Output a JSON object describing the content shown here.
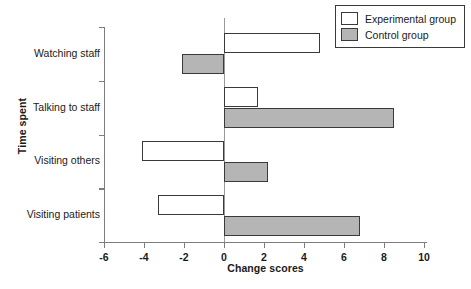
{
  "chart_data": {
    "type": "bar",
    "orientation": "horizontal",
    "title": "",
    "xlabel": "Change scores",
    "ylabel": "Time spent",
    "categories": [
      "Watching staff",
      "Talking to staff",
      "Visiting others",
      "Visiting patients"
    ],
    "series": [
      {
        "name": "Experimental group",
        "color": "#ffffff",
        "values": [
          4.8,
          1.7,
          -4.1,
          -3.3
        ]
      },
      {
        "name": "Control group",
        "color": "#b5b5b5",
        "values": [
          -2.1,
          8.5,
          2.2,
          6.8
        ]
      }
    ],
    "xlim": [
      -6,
      10
    ],
    "xticks": [
      -6,
      -4,
      -2,
      0,
      2,
      4,
      6,
      8,
      10
    ],
    "xtick_labels": [
      "-6",
      "-4",
      "-2",
      "0",
      "2",
      "4",
      "6",
      "8",
      "10"
    ],
    "grid": false,
    "legend_position": "top-right",
    "zero_reference_line": true
  },
  "legend": {
    "entries": [
      {
        "label": "Experimental group",
        "swatch": "white-swatch"
      },
      {
        "label": "Control group",
        "swatch": "gray-swatch"
      }
    ]
  },
  "colors": {
    "control_fill": "#b5b5b5",
    "experimental_fill": "#ffffff",
    "bar_outline": "#3a3a3a",
    "axis": "#7d7d7d",
    "text": "#1a1a1a"
  }
}
